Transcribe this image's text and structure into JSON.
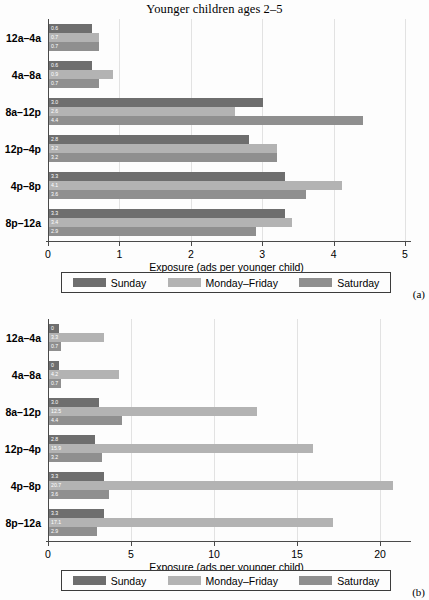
{
  "figure": {
    "title": "Younger children ages 2–5",
    "background": "#fdfdfd"
  },
  "series_colors": {
    "sunday": "#6e6e6e",
    "monday_friday": "#b3b3b3",
    "saturday": "#8f8f8f"
  },
  "legend": {
    "items": [
      {
        "label": "Sunday",
        "color": "#6e6e6e",
        "swatch_name": "legend-swatch-sunday"
      },
      {
        "label": "Monday–Friday",
        "color": "#b3b3b3",
        "swatch_name": "legend-swatch-monday-friday"
      },
      {
        "label": "Saturday",
        "color": "#8f8f8f",
        "swatch_name": "legend-swatch-saturday"
      }
    ]
  },
  "panels": [
    {
      "tag": "(a)"
    },
    {
      "tag": "(b)"
    }
  ],
  "chart_data": [
    {
      "type": "bar",
      "orientation": "horizontal",
      "panel": "(a)",
      "title": "Younger children ages 2–5",
      "xlabel": "Exposure (ads per younger child)",
      "ylabel": "",
      "xlim": [
        0,
        5
      ],
      "xticks": [
        0,
        1,
        2,
        3,
        4,
        5
      ],
      "xticklabels": [
        "0",
        "1",
        "2",
        "3",
        "4",
        "5"
      ],
      "grid": true,
      "legend_position": "below",
      "categories": [
        "12a–4a",
        "4a–8a",
        "8a–12p",
        "12p–4p",
        "4p–8p",
        "8p–12a"
      ],
      "series": [
        {
          "name": "Sunday",
          "color": "#6e6e6e",
          "values": [
            0.6,
            0.6,
            3.0,
            2.8,
            3.3,
            3.3
          ],
          "labels": [
            "0.6",
            "0.6",
            "3.0",
            "2.8",
            "3.3",
            "3.3"
          ]
        },
        {
          "name": "Monday–Friday",
          "color": "#b3b3b3",
          "values": [
            0.7,
            0.9,
            2.6,
            3.2,
            4.1,
            3.4
          ],
          "labels": [
            "0.7",
            "0.9",
            "2.6",
            "3.2",
            "4.1",
            "3.4"
          ]
        },
        {
          "name": "Saturday",
          "color": "#8f8f8f",
          "values": [
            0.7,
            0.7,
            4.4,
            3.2,
            3.6,
            2.9
          ],
          "labels": [
            "0.7",
            "0.7",
            "4.4",
            "3.2",
            "3.6",
            "2.9"
          ]
        }
      ]
    },
    {
      "type": "bar",
      "orientation": "horizontal",
      "panel": "(b)",
      "title": "",
      "xlabel": "Exposure (ads per younger child)",
      "ylabel": "",
      "xlim": [
        0,
        21.5
      ],
      "xticks": [
        0,
        5,
        10,
        15,
        20
      ],
      "xticklabels": [
        "0",
        "5",
        "10",
        "15",
        "20"
      ],
      "grid": true,
      "legend_position": "below",
      "categories": [
        "12a–4a",
        "4a–8a",
        "8a–12p",
        "12p–4p",
        "4p–8p",
        "8p–12a"
      ],
      "series": [
        {
          "name": "Sunday",
          "color": "#6e6e6e",
          "values": [
            0.6,
            0.6,
            3.0,
            2.8,
            3.3,
            3.3
          ],
          "labels": [
            "0",
            "0",
            "3.0",
            "2.8",
            "3.3",
            "3.3"
          ]
        },
        {
          "name": "Monday–Friday",
          "color": "#b3b3b3",
          "values": [
            3.3,
            4.2,
            12.5,
            15.9,
            20.7,
            17.1
          ],
          "labels": [
            "3.3",
            "4.2",
            "12.5",
            "15.9",
            "20.7",
            "17.1"
          ]
        },
        {
          "name": "Saturday",
          "color": "#8f8f8f",
          "values": [
            0.7,
            0.7,
            4.4,
            3.2,
            3.6,
            2.9
          ],
          "labels": [
            "0.7",
            "0.7",
            "4.4",
            "3.2",
            "3.6",
            "2.9"
          ]
        }
      ]
    }
  ]
}
